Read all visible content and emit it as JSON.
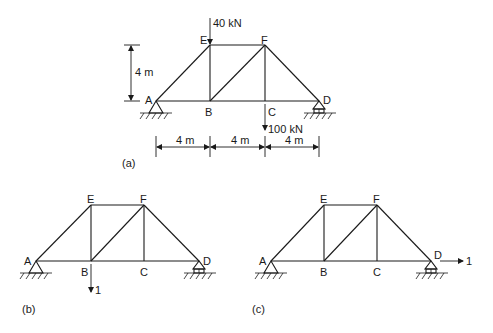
{
  "figure": {
    "diagrams": [
      {
        "id": "a",
        "caption": "(a)",
        "nodes": {
          "A": "A",
          "B": "B",
          "C": "C",
          "D": "D",
          "E": "E",
          "F": "F"
        },
        "loads": [
          {
            "node": "E",
            "direction": "down",
            "label": "40 kN"
          },
          {
            "node": "C",
            "direction": "down",
            "label": "100 kN"
          }
        ],
        "dimensions": {
          "height": "4 m",
          "spans": [
            "4 m",
            "4 m",
            "4 m"
          ]
        }
      },
      {
        "id": "b",
        "caption": "(b)",
        "nodes": {
          "A": "A",
          "B": "B",
          "C": "C",
          "D": "D",
          "E": "E",
          "F": "F"
        },
        "loads": [
          {
            "node": "B",
            "direction": "down",
            "label": "1"
          }
        ]
      },
      {
        "id": "c",
        "caption": "(c)",
        "nodes": {
          "A": "A",
          "B": "B",
          "C": "C",
          "D": "D",
          "E": "E",
          "F": "F"
        },
        "loads": [
          {
            "node": "D",
            "direction": "right",
            "label": "1"
          }
        ]
      }
    ],
    "members": [
      "AE",
      "EF",
      "FD",
      "AB",
      "BC",
      "CD",
      "EB",
      "BF",
      "FC"
    ],
    "supports": {
      "A": "pin",
      "D": "roller"
    }
  }
}
